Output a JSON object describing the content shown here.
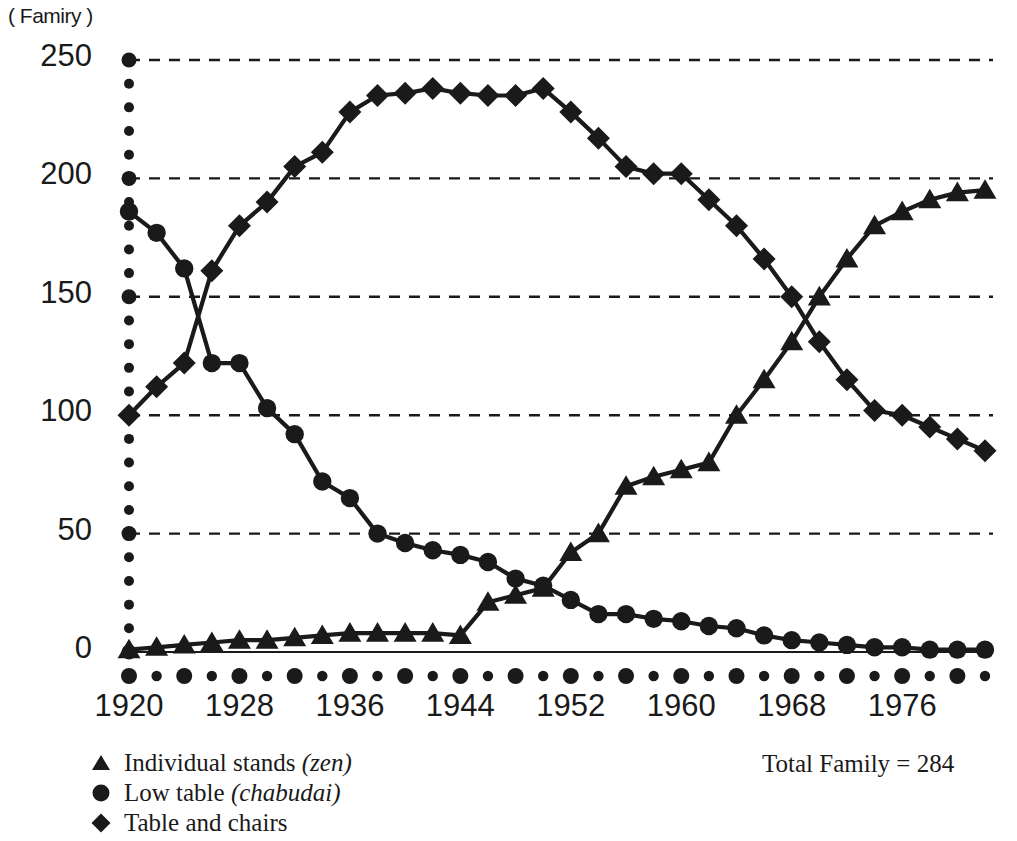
{
  "axis": {
    "unit_label": "( Famiry )",
    "y_ticks": [
      "0",
      "50",
      "100",
      "150",
      "200",
      "250"
    ],
    "x_ticks": [
      "1920",
      "1928",
      "1936",
      "1944",
      "1952",
      "1960",
      "1968",
      "1976"
    ]
  },
  "legend": {
    "items": [
      {
        "marker": "triangle-marker",
        "label": "Individual stands ",
        "emph": "(zen)"
      },
      {
        "marker": "circle-marker",
        "label": "Low table ",
        "emph": "(chabudai)"
      },
      {
        "marker": "diamond-marker",
        "label": "Table and chairs",
        "emph": ""
      }
    ]
  },
  "annotation": {
    "total_family": "Total Family = 284"
  },
  "chart_data": {
    "type": "line",
    "title": "",
    "xlabel": "",
    "ylabel": "( Famiry )",
    "xlim": [
      1920,
      1982
    ],
    "ylim": [
      0,
      250
    ],
    "grid": "horizontal-dashed",
    "legend_position": "below-left",
    "annotations": [
      "Total Family = 284"
    ],
    "x": [
      1920,
      1922,
      1924,
      1926,
      1928,
      1930,
      1932,
      1934,
      1936,
      1938,
      1940,
      1942,
      1944,
      1946,
      1948,
      1950,
      1952,
      1954,
      1956,
      1958,
      1960,
      1962,
      1964,
      1966,
      1968,
      1970,
      1972,
      1974,
      1976,
      1978,
      1980,
      1982
    ],
    "series": [
      {
        "name": "Individual stands (zen)",
        "marker": "triangle",
        "values": [
          1,
          2,
          3,
          4,
          5,
          5,
          6,
          7,
          8,
          8,
          8,
          8,
          7,
          21,
          24,
          27,
          42,
          50,
          70,
          74,
          77,
          80,
          100,
          115,
          131,
          150,
          166,
          180,
          186,
          191,
          194,
          195
        ]
      },
      {
        "name": "Low table (chabudai)",
        "marker": "circle",
        "values": [
          186,
          177,
          162,
          122,
          122,
          103,
          92,
          72,
          65,
          50,
          46,
          43,
          41,
          38,
          31,
          28,
          22,
          16,
          16,
          14,
          13,
          11,
          10,
          7,
          5,
          4,
          3,
          2,
          2,
          1,
          1,
          1
        ]
      },
      {
        "name": "Table and chairs",
        "marker": "diamond",
        "values": [
          100,
          112,
          122,
          161,
          180,
          190,
          205,
          211,
          228,
          235,
          236,
          238,
          236,
          235,
          235,
          238,
          228,
          217,
          205,
          202,
          202,
          191,
          180,
          166,
          150,
          131,
          115,
          102,
          100,
          95,
          90,
          85
        ]
      }
    ]
  }
}
